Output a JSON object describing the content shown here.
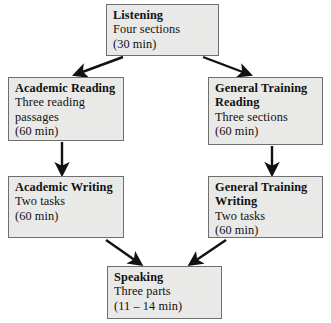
{
  "diagram": {
    "type": "flowchart",
    "colors": {
      "box_fill": "#e9e9e7",
      "box_border": "#6f6f6f",
      "arrow": "#111111",
      "background": "#ffffff"
    },
    "nodes": [
      {
        "id": "listening",
        "title": "Listening",
        "line1": "Four sections",
        "line2": "(30 min)"
      },
      {
        "id": "academic-reading",
        "title": "Academic Reading",
        "line1": "Three reading",
        "line2": "passages",
        "line3": "(60 min)"
      },
      {
        "id": "general-training-reading",
        "title": "General Training",
        "title2": "Reading",
        "line1": "Three sections",
        "line2": "(60 min)"
      },
      {
        "id": "academic-writing",
        "title": "Academic Writing",
        "line1": "Two tasks",
        "line2": "(60 min)"
      },
      {
        "id": "general-training-writing",
        "title": "General Training",
        "title2": "Writing",
        "line1": "Two tasks",
        "line2": "(60 min)"
      },
      {
        "id": "speaking",
        "title": "Speaking",
        "line1": "Three parts",
        "line2": "(11 – 14 min)"
      }
    ],
    "edges": [
      {
        "id": "listening-to-academic-reading",
        "from": "listening",
        "to": "academic-reading",
        "style": "diagonal-left"
      },
      {
        "id": "listening-to-general-training-reading",
        "from": "listening",
        "to": "general-training-reading",
        "style": "diagonal-right"
      },
      {
        "id": "academic-reading-to-academic-writing",
        "from": "academic-reading",
        "to": "academic-writing",
        "style": "vertical"
      },
      {
        "id": "general-training-reading-to-general-training-writing",
        "from": "general-training-reading",
        "to": "general-training-writing",
        "style": "vertical"
      },
      {
        "id": "academic-writing-to-speaking",
        "from": "academic-writing",
        "to": "speaking",
        "style": "diagonal-right"
      },
      {
        "id": "general-training-writing-to-speaking",
        "from": "general-training-writing",
        "to": "speaking",
        "style": "diagonal-left"
      }
    ]
  }
}
